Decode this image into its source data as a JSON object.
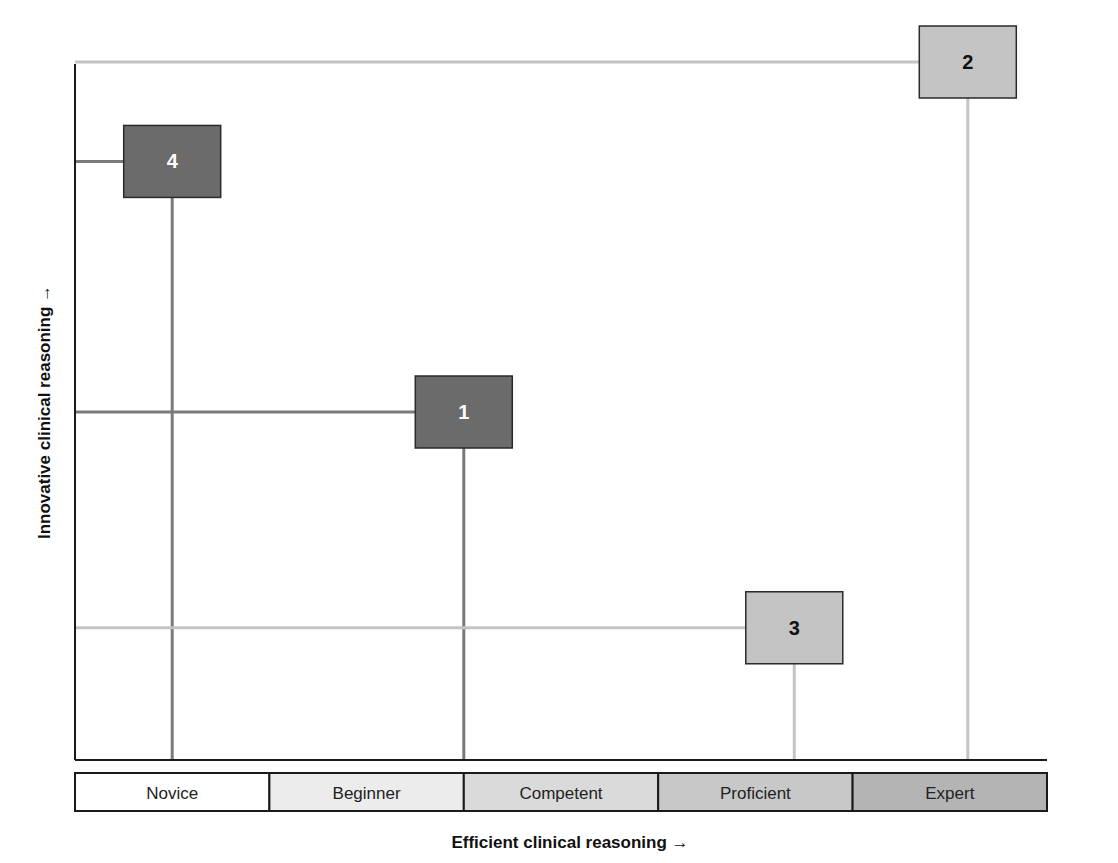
{
  "diagram": {
    "x_axis_title": "Efficient clinical reasoning →",
    "y_axis_title": "Innovative clinical reasoning →",
    "x_levels": [
      {
        "label": "Novice",
        "color": "#ffffff"
      },
      {
        "label": "Beginner",
        "color": "#ececec"
      },
      {
        "label": "Competent",
        "color": "#dadada"
      },
      {
        "label": "Proficient",
        "color": "#c8c8c8"
      },
      {
        "label": "Expert",
        "color": "#b4b4b4"
      }
    ],
    "quadrant_points": [
      {
        "label": "4",
        "efficiency_level": 1.0,
        "innovation": 0.86,
        "fill": "#6b6b6b",
        "text_color": "#ffffff",
        "line_color": "#7a7a7a"
      },
      {
        "label": "1",
        "efficiency_level": 2.5,
        "innovation": 0.5,
        "fill": "#6b6b6b",
        "text_color": "#ffffff",
        "line_color": "#7a7a7a"
      },
      {
        "label": "3",
        "efficiency_level": 4.2,
        "innovation": 0.19,
        "fill": "#c4c4c4",
        "text_color": "#111111",
        "line_color": "#c4c4c4"
      },
      {
        "label": "2",
        "efficiency_level": 5.0,
        "innovation": 1.0,
        "fill": "#c4c4c4",
        "text_color": "#111111",
        "line_color": "#c4c4c4"
      }
    ]
  }
}
